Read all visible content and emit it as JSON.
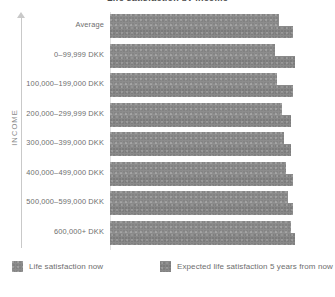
{
  "chart_data": {
    "type": "bar",
    "orientation": "horizontal",
    "title": "Life satisfaction by income",
    "xlabel": "",
    "ylabel": "INCOME",
    "grid": false,
    "legend_position": "bottom",
    "categories": [
      "Average",
      "0–99,999 DKK",
      "100,000–199,000 DKK",
      "200,000–299,999 DKK",
      "300,000–399,000 DKK",
      "400,000–499,000 DKK",
      "500,000–599,000 DKK",
      "600,000+ DKK"
    ],
    "series": [
      {
        "name": "Life satisfaction now",
        "color": "#8c8c8c",
        "values": [
          7.6,
          7.4,
          7.5,
          7.7,
          7.8,
          7.9,
          8.0,
          8.1
        ]
      },
      {
        "name": "Expected life satisfaction 5 years from now",
        "color": "#888888",
        "values": [
          8.2,
          8.3,
          8.2,
          8.1,
          8.1,
          8.2,
          8.2,
          8.3
        ]
      }
    ],
    "xlim": [
      0,
      10
    ]
  },
  "axis": {
    "y_title": "INCOME",
    "arrow_icon": "arrow-up-icon"
  },
  "legend": {
    "items": [
      {
        "label": "Life satisfaction now",
        "swatch": "#8e8e8e"
      },
      {
        "label": "Expected life satisfaction 5 years from now",
        "swatch": "#8a8a8a"
      }
    ]
  }
}
